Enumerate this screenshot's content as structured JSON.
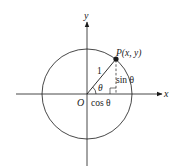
{
  "diagram": {
    "type": "unit-circle",
    "labels": {
      "y_axis": "y",
      "x_axis": "x",
      "origin": "O",
      "point": "P(x, y)",
      "radius": "1",
      "angle": "θ",
      "sin": "sin θ",
      "cos": "cos θ"
    },
    "geometry": {
      "center": [
        87,
        94
      ],
      "radius": 45,
      "point_P": [
        116,
        59
      ]
    },
    "colors": {
      "stroke": "#1a1a1a",
      "background": "#ffffff"
    }
  }
}
